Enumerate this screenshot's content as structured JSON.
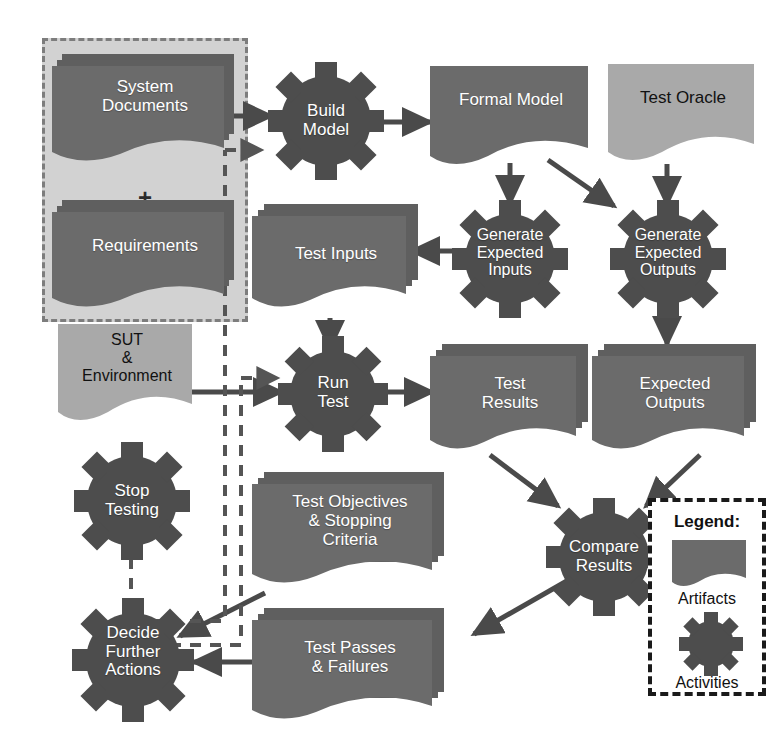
{
  "diagram": {
    "colors": {
      "artifact_dark": "#6b6b6b",
      "artifact_light": "#a9a9a9",
      "activity_gear": "#4d4d4d",
      "group_fill": "#d2d2d2",
      "group_border": "#7d7d7d",
      "arrow_solid": "#4a4a4a",
      "arrow_dashed": "#555555",
      "legend_border": "#1a1a1a",
      "text_on_dark": "#ffffff",
      "text_on_light": "#111111",
      "background": "#ffffff"
    },
    "group": {
      "plus_symbol": "+"
    },
    "artifacts": [
      {
        "id": "system-documents",
        "label": "System\nDocuments",
        "shade": "dark",
        "stacked": true
      },
      {
        "id": "requirements",
        "label": "Requirements",
        "shade": "dark",
        "stacked": true
      },
      {
        "id": "formal-model",
        "label": "Formal Model",
        "shade": "dark",
        "stacked": false
      },
      {
        "id": "test-oracle",
        "label": "Test Oracle",
        "shade": "light",
        "stacked": false
      },
      {
        "id": "test-inputs",
        "label": "Test Inputs",
        "shade": "dark",
        "stacked": true
      },
      {
        "id": "sut-environment",
        "label": "SUT\n&\nEnvironment",
        "shade": "light",
        "stacked": false
      },
      {
        "id": "test-results",
        "label": "Test\nResults",
        "shade": "dark",
        "stacked": true
      },
      {
        "id": "expected-outputs",
        "label": "Expected\nOutputs",
        "shade": "dark",
        "stacked": true
      },
      {
        "id": "test-objectives",
        "label": "Test Objectives\n& Stopping\nCriteria",
        "shade": "dark",
        "stacked": true
      },
      {
        "id": "test-passes",
        "label": "Test Passes\n& Failures",
        "shade": "dark",
        "stacked": true
      }
    ],
    "activities": [
      {
        "id": "build-model",
        "label": "Build\nModel"
      },
      {
        "id": "generate-expected-inputs",
        "label": "Generate\nExpected\nInputs"
      },
      {
        "id": "generate-expected-outputs",
        "label": "Generate\nExpected\nOutputs"
      },
      {
        "id": "run-test",
        "label": "Run\nTest"
      },
      {
        "id": "compare-results",
        "label": "Compare\nResults"
      },
      {
        "id": "stop-testing",
        "label": "Stop\nTesting"
      },
      {
        "id": "decide-further-actions",
        "label": "Decide\nFurther\nActions"
      }
    ],
    "legend": {
      "title": "Legend:",
      "artifact_caption": "Artifacts",
      "activity_caption": "Activities"
    },
    "flows": [
      {
        "from": "system-documents",
        "to": "build-model",
        "style": "solid"
      },
      {
        "from": "build-model",
        "to": "formal-model",
        "style": "solid"
      },
      {
        "from": "formal-model",
        "to": "generate-expected-inputs",
        "style": "solid"
      },
      {
        "from": "formal-model",
        "to": "generate-expected-outputs",
        "style": "solid"
      },
      {
        "from": "test-oracle",
        "to": "generate-expected-outputs",
        "style": "solid"
      },
      {
        "from": "generate-expected-inputs",
        "to": "test-inputs",
        "style": "solid"
      },
      {
        "from": "generate-expected-outputs",
        "to": "expected-outputs",
        "style": "solid"
      },
      {
        "from": "test-inputs",
        "to": "run-test",
        "style": "solid"
      },
      {
        "from": "sut-environment",
        "to": "run-test",
        "style": "solid"
      },
      {
        "from": "run-test",
        "to": "test-results",
        "style": "solid"
      },
      {
        "from": "test-results",
        "to": "compare-results",
        "style": "solid"
      },
      {
        "from": "expected-outputs",
        "to": "compare-results",
        "style": "solid"
      },
      {
        "from": "compare-results",
        "to": "test-passes",
        "style": "solid"
      },
      {
        "from": "test-passes",
        "to": "decide-further-actions",
        "style": "solid"
      },
      {
        "from": "test-objectives",
        "to": "decide-further-actions",
        "style": "solid"
      },
      {
        "from": "decide-further-actions",
        "to": "stop-testing",
        "style": "dashed"
      },
      {
        "from": "decide-further-actions",
        "to": "build-model",
        "style": "dashed"
      },
      {
        "from": "decide-further-actions",
        "to": "run-test",
        "style": "dashed"
      }
    ]
  }
}
